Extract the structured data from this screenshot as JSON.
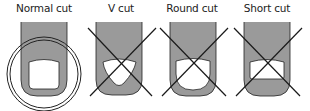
{
  "panels": [
    {
      "label": "Normal cut",
      "status": "correct"
    },
    {
      "label": "V cut",
      "status": "incorrect"
    },
    {
      "label": "Round cut",
      "status": "incorrect"
    },
    {
      "label": "Short cut",
      "status": "incorrect"
    }
  ],
  "colors": {
    "finger": "#9a9a9a",
    "outline": "#222222",
    "nail": "#ffffff",
    "cross": "#1a1a1a"
  }
}
